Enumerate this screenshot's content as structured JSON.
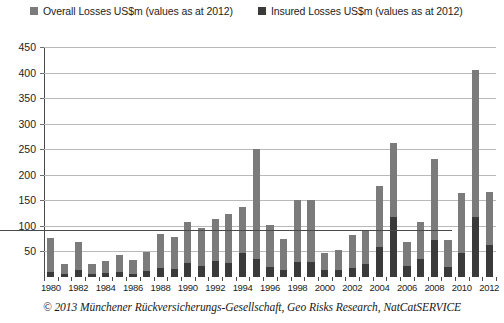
{
  "chart_data": {
    "type": "bar",
    "title": "",
    "subtitle": "",
    "xlabel": "",
    "ylabel": "",
    "stacked": true,
    "grid": true,
    "legend_position": "top",
    "ylim": [
      0,
      450
    ],
    "yticks": [
      0,
      50,
      100,
      150,
      200,
      250,
      300,
      350,
      400,
      450
    ],
    "ytick_labels": [
      "",
      "50",
      "100",
      "150",
      "200",
      "250",
      "300",
      "350",
      "400",
      "450"
    ],
    "categories": [
      "1980",
      "1981",
      "1982",
      "1983",
      "1984",
      "1985",
      "1986",
      "1987",
      "1988",
      "1989",
      "1990",
      "1991",
      "1992",
      "1993",
      "1994",
      "1995",
      "1996",
      "1997",
      "1998",
      "1999",
      "2000",
      "2001",
      "2002",
      "2003",
      "2004",
      "2005",
      "2006",
      "2007",
      "2008",
      "2009",
      "2010",
      "2011",
      "2012"
    ],
    "xtick_labels": [
      "1980",
      "1982",
      "1984",
      "1986",
      "1988",
      "1990",
      "1992",
      "1994",
      "1996",
      "1998",
      "2000",
      "2002",
      "2004",
      "2006",
      "2008",
      "2010",
      "2012"
    ],
    "series": [
      {
        "name": "Overall Losses US$m (values as at 2012)",
        "color": "#7b7b7b",
        "values": [
          77,
          25,
          68,
          25,
          32,
          44,
          34,
          49,
          85,
          78,
          107,
          96,
          113,
          123,
          137,
          251,
          102,
          75,
          151,
          150,
          47,
          53,
          82,
          91,
          179,
          263,
          69,
          108,
          230,
          73,
          165,
          405,
          167
        ]
      },
      {
        "name": "Insured Losses US$m (values as at 2012)",
        "color": "#3a3a3a",
        "values": [
          10,
          5,
          13,
          6,
          7,
          9,
          6,
          11,
          17,
          16,
          27,
          22,
          32,
          27,
          47,
          36,
          20,
          14,
          30,
          29,
          13,
          14,
          17,
          26,
          58,
          117,
          22,
          35,
          72,
          20,
          47,
          118,
          63
        ]
      }
    ]
  },
  "legend": {
    "entries": [
      {
        "label": "Overall Losses US$m (values as at 2012)",
        "color": "#7b7b7b"
      },
      {
        "label": "Insured Losses US$m (values as at 2012)",
        "color": "#3a3a3a"
      }
    ]
  },
  "caption": {
    "text": "© 2013 Münchener Rückversicherungs-Gesellschaft, Geo Risks Research, NatCatSERVICE"
  },
  "colors": {
    "overall_losses": "#7b7b7b",
    "insured_losses": "#3a3a3a",
    "gridline": "#b9b9b9",
    "axis": "#4a4a4a",
    "background": "#ffffff",
    "text": "#1d1d1d"
  }
}
